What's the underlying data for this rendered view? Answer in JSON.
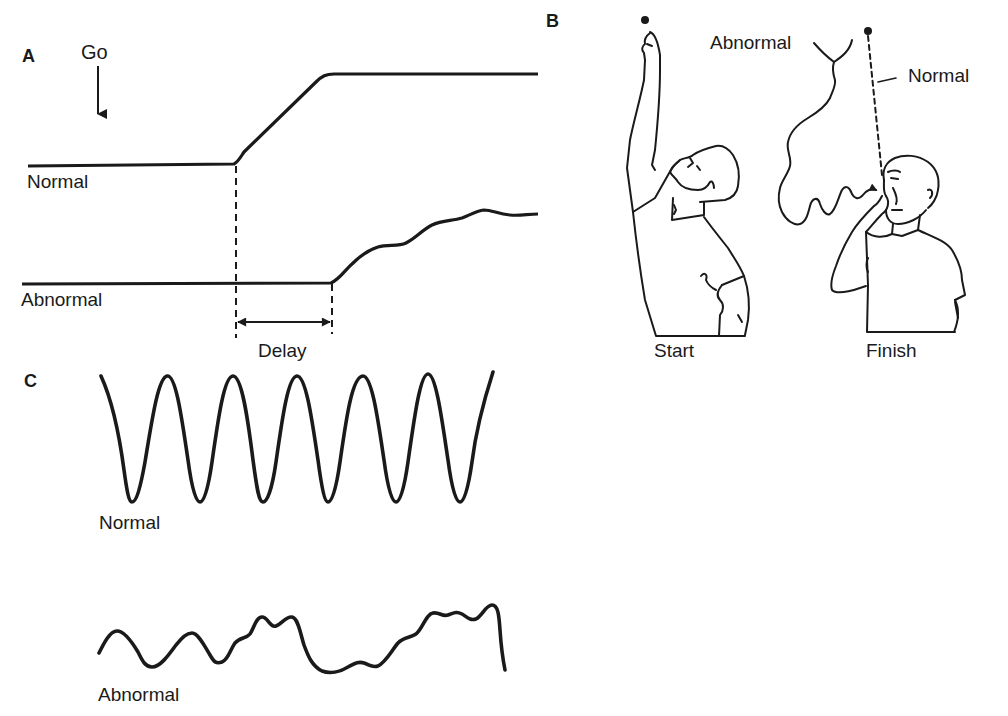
{
  "panels": {
    "a": {
      "letter": "A",
      "go_label": "Go",
      "normal_label": "Normal",
      "abnormal_label": "Abnormal",
      "delay_label": "Delay"
    },
    "b": {
      "letter": "B",
      "abnormal_label": "Abnormal",
      "normal_label": "Normal",
      "start_label": "Start",
      "finish_label": "Finish"
    },
    "c": {
      "letter": "C",
      "normal_label": "Normal",
      "abnormal_label": "Abnormal"
    }
  },
  "colors": {
    "ink": "#1a1a1a",
    "background": "#ffffff"
  }
}
